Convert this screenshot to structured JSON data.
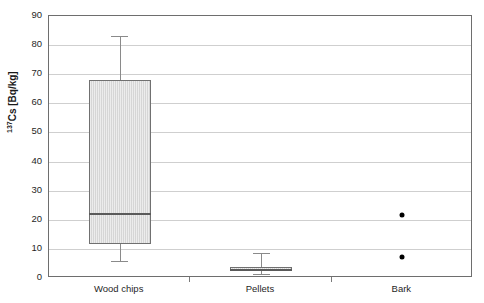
{
  "chart_data": {
    "type": "box",
    "title": "",
    "subtitle": "",
    "xlabel": "",
    "ylabel": "137Cs [Bq/kg]",
    "ylabel_prefix": "137",
    "ylabel_main": "Cs [Bq/kg]",
    "categories": [
      "Wood chips",
      "Pellets",
      "Bark"
    ],
    "ylim": [
      0,
      90
    ],
    "yticks": [
      90,
      80,
      70,
      60,
      50,
      40,
      30,
      20,
      10,
      0
    ],
    "ytick_labels": [
      "90",
      "80",
      "70",
      "60",
      "50",
      "40",
      "30",
      "20",
      "10",
      "0"
    ],
    "grid": "horizontal",
    "legend": "none",
    "series": [
      {
        "name": "Wood chips",
        "has_box": true,
        "whisker_low": 5.8,
        "q1": 11.7,
        "median": 22.0,
        "q3": 68.0,
        "whisker_high": 83.0,
        "outliers": []
      },
      {
        "name": "Pellets",
        "has_box": true,
        "whisker_low": 1.5,
        "q1": 2.5,
        "median": 2.9,
        "q3": 3.8,
        "whisker_high": 8.5,
        "outliers": []
      },
      {
        "name": "Bark",
        "has_box": false,
        "whisker_low": null,
        "q1": null,
        "median": null,
        "q3": null,
        "whisker_high": null,
        "outliers": [
          21.5,
          7.3
        ]
      }
    ],
    "colors": {
      "box_fill": "#d6d6d6",
      "box_border": "#707070",
      "median": "#5a5a5a",
      "whisker": "#8a8a8a",
      "point": "#000000",
      "gridline": "#cfcfcf",
      "frame": "#6e6e6e",
      "text": "#1f1f1f",
      "background": "#ffffff"
    }
  }
}
